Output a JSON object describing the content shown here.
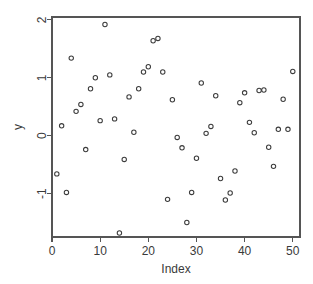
{
  "chart_data": {
    "type": "scatter",
    "title": "",
    "subtitle": "",
    "xlabel": "Index",
    "ylabel": "y",
    "xlim": [
      0.0,
      51.5
    ],
    "ylim": [
      -1.75,
      2.05
    ],
    "xticks": [
      0,
      10,
      20,
      30,
      40,
      50
    ],
    "xticklabels": [
      "0",
      "10",
      "20",
      "30",
      "40",
      "50"
    ],
    "yticks": [
      -1,
      0,
      1,
      2
    ],
    "yticklabels": [
      "-1",
      "0",
      "1",
      "2"
    ],
    "grid": false,
    "legend": null,
    "marker": "open-circle",
    "marker_size": 3,
    "point_color": "#3c3c3c",
    "axis_color": "#555555",
    "background_color": "#ffffff",
    "box_border": true,
    "x": [
      1,
      2,
      3,
      4,
      5,
      6,
      7,
      8,
      9,
      10,
      11,
      12,
      13,
      14,
      15,
      16,
      17,
      18,
      19,
      20,
      21,
      22,
      23,
      24,
      25,
      26,
      27,
      28,
      29,
      30,
      31,
      32,
      33,
      34,
      35,
      36,
      37,
      38,
      39,
      40,
      41,
      42,
      43,
      44,
      45,
      46,
      47,
      48,
      49,
      50
    ],
    "y": [
      -0.66,
      0.17,
      -0.98,
      1.34,
      0.42,
      0.54,
      -0.24,
      0.81,
      1.0,
      0.26,
      1.92,
      1.05,
      0.29,
      -1.68,
      -0.41,
      0.67,
      0.06,
      0.81,
      1.1,
      1.19,
      1.64,
      1.68,
      1.1,
      -1.1,
      0.62,
      -0.03,
      -0.21,
      -1.5,
      -0.98,
      -0.39,
      0.91,
      0.04,
      0.16,
      0.69,
      -0.74,
      -1.11,
      -0.99,
      -0.61,
      0.57,
      0.74,
      0.23,
      0.05,
      0.78,
      0.79,
      -0.2,
      -0.53,
      0.11,
      0.63,
      0.11,
      1.11
    ],
    "series": [
      {
        "name": "y",
        "points": [
          {
            "x": 1,
            "y": -0.66
          },
          {
            "x": 2,
            "y": 0.17
          },
          {
            "x": 3,
            "y": -0.98
          },
          {
            "x": 4,
            "y": 1.34
          },
          {
            "x": 5,
            "y": 0.42
          },
          {
            "x": 6,
            "y": 0.54
          },
          {
            "x": 7,
            "y": -0.24
          },
          {
            "x": 8,
            "y": 0.81
          },
          {
            "x": 9,
            "y": 1.0
          },
          {
            "x": 10,
            "y": 0.26
          },
          {
            "x": 11,
            "y": 1.92
          },
          {
            "x": 12,
            "y": 1.05
          },
          {
            "x": 13,
            "y": 0.29
          },
          {
            "x": 14,
            "y": -1.68
          },
          {
            "x": 15,
            "y": -0.41
          },
          {
            "x": 16,
            "y": 0.67
          },
          {
            "x": 17,
            "y": 0.06
          },
          {
            "x": 18,
            "y": 0.81
          },
          {
            "x": 19,
            "y": 1.1
          },
          {
            "x": 20,
            "y": 1.19
          },
          {
            "x": 21,
            "y": 1.64
          },
          {
            "x": 22,
            "y": 1.68
          },
          {
            "x": 23,
            "y": 1.1
          },
          {
            "x": 24,
            "y": -1.1
          },
          {
            "x": 25,
            "y": 0.62
          },
          {
            "x": 26,
            "y": -0.03
          },
          {
            "x": 27,
            "y": -0.21
          },
          {
            "x": 28,
            "y": -1.5
          },
          {
            "x": 29,
            "y": -0.98
          },
          {
            "x": 30,
            "y": -0.39
          },
          {
            "x": 31,
            "y": 0.91
          },
          {
            "x": 32,
            "y": 0.04
          },
          {
            "x": 33,
            "y": 0.16
          },
          {
            "x": 34,
            "y": 0.69
          },
          {
            "x": 35,
            "y": -0.74
          },
          {
            "x": 36,
            "y": -1.11
          },
          {
            "x": 37,
            "y": -0.99
          },
          {
            "x": 38,
            "y": -0.61
          },
          {
            "x": 39,
            "y": 0.57
          },
          {
            "x": 40,
            "y": 0.74
          },
          {
            "x": 41,
            "y": 0.23
          },
          {
            "x": 42,
            "y": 0.05
          },
          {
            "x": 43,
            "y": 0.78
          },
          {
            "x": 44,
            "y": 0.79
          },
          {
            "x": 45,
            "y": -0.2
          },
          {
            "x": 46,
            "y": -0.53
          },
          {
            "x": 47,
            "y": 0.11
          },
          {
            "x": 48,
            "y": 0.63
          },
          {
            "x": 49,
            "y": 0.11
          },
          {
            "x": 50,
            "y": 1.11
          }
        ]
      }
    ]
  }
}
